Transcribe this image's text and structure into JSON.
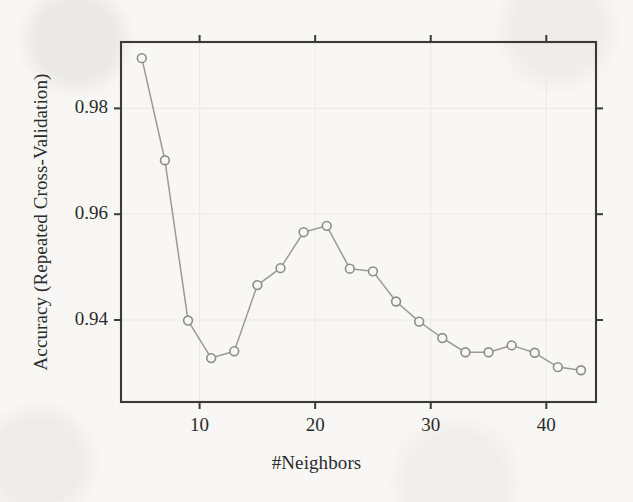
{
  "chart_data": {
    "type": "line",
    "title": "",
    "subtitle": "",
    "xlabel": "#Neighbors",
    "ylabel": "Accuracy (Repeated Cross-Validation)",
    "x": [
      5,
      7,
      9,
      11,
      13,
      15,
      17,
      19,
      21,
      23,
      25,
      27,
      29,
      31,
      33,
      35,
      37,
      39,
      41,
      43
    ],
    "values": [
      0.9895,
      0.9702,
      0.9399,
      0.9328,
      0.9341,
      0.9466,
      0.9498,
      0.9566,
      0.9578,
      0.9497,
      0.9492,
      0.9435,
      0.9397,
      0.9366,
      0.9339,
      0.9339,
      0.9352,
      0.9338,
      0.9311,
      0.9305
    ],
    "series": [
      {
        "name": "Accuracy",
        "x": [
          5,
          7,
          9,
          11,
          13,
          15,
          17,
          19,
          21,
          23,
          25,
          27,
          29,
          31,
          33,
          35,
          37,
          39,
          41,
          43
        ],
        "values": [
          0.9895,
          0.9702,
          0.9399,
          0.9328,
          0.9341,
          0.9466,
          0.9498,
          0.9566,
          0.9578,
          0.9497,
          0.9492,
          0.9435,
          0.9397,
          0.9366,
          0.9339,
          0.9339,
          0.9352,
          0.9338,
          0.9311,
          0.9305
        ],
        "marker": "open-circle",
        "line_color": "#9a9a96",
        "marker_color": "#8d8d88"
      }
    ],
    "xlim": [
      3.2,
      44.3
    ],
    "ylim": [
      0.9245,
      0.99255
    ],
    "xticks": [
      10,
      20,
      30,
      40
    ],
    "xtick_labels": [
      "10",
      "20",
      "30",
      "40"
    ],
    "yticks": [
      0.94,
      0.96,
      0.98
    ],
    "ytick_labels": [
      "0.94",
      "0.96",
      "0.98"
    ],
    "grid": true,
    "grid_color": "#ece9e4",
    "legend": null,
    "legend_position": "none",
    "box_frame": true,
    "tick_direction": "out",
    "axis_color": "#3a3a38",
    "background_color": "#f8f7f5",
    "annotations": []
  },
  "labels": {
    "x_axis_title": "#Neighbors",
    "y_axis_title": "Accuracy (Repeated Cross-Validation)"
  },
  "figure": {
    "plot_left": 121,
    "plot_right": 596,
    "plot_top": 42,
    "plot_bottom": 402
  }
}
